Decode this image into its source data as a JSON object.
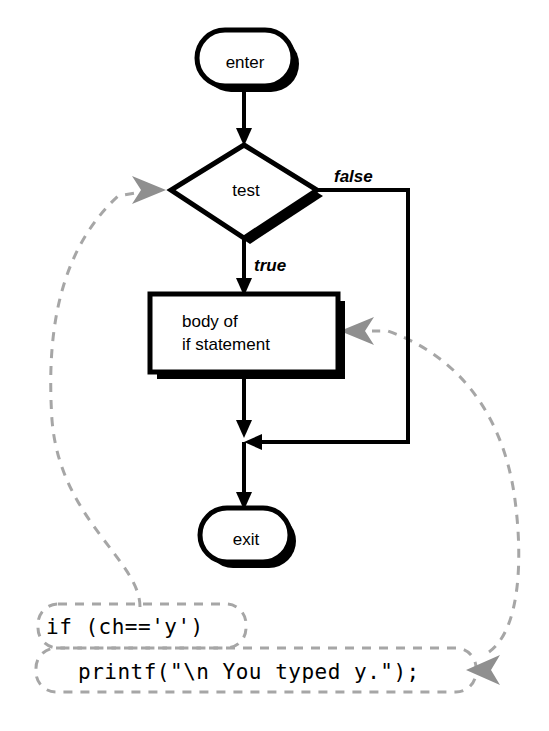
{
  "diagram": {
    "nodes": {
      "enter": {
        "label": "enter",
        "shape": "terminator"
      },
      "test": {
        "label": "test",
        "shape": "decision"
      },
      "body": {
        "label_line1": "body of",
        "label_line2": "if statement",
        "shape": "process"
      },
      "exit": {
        "label": "exit",
        "shape": "terminator"
      }
    },
    "edge_labels": {
      "true": "true",
      "false": "false"
    },
    "code": {
      "line1": "if (ch=='y')",
      "line2": "printf(\"\\n You typed y.\");"
    },
    "colors": {
      "shape_stroke": "#000000",
      "shape_fill": "#ffffff",
      "flow_line": "#000000",
      "dashed_link": "#a6a6a6",
      "dashed_arrowhead": "#8f8f8f",
      "background": "#ffffff"
    }
  }
}
